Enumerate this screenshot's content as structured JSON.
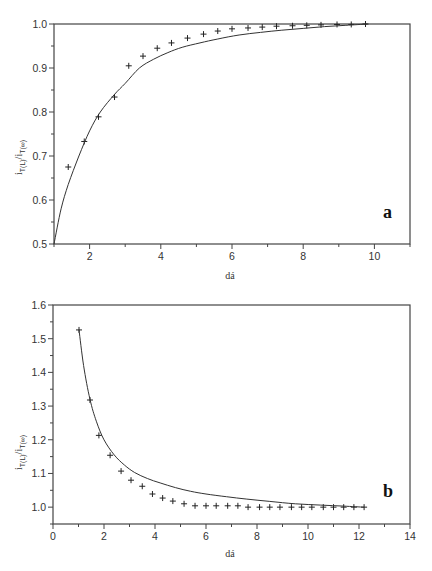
{
  "chart_data": [
    {
      "type": "scatter",
      "panel": "a",
      "title": "",
      "panel_label": "a",
      "xlabel": "dá",
      "ylabel": {
        "main": "i",
        "sub1": "T(L)",
        "slash": "/",
        "main2": "i",
        "sub2": "T(∞)"
      },
      "xlim": [
        1,
        11
      ],
      "ylim": [
        0.5,
        1.0
      ],
      "xticks": [
        2,
        4,
        6,
        8,
        10
      ],
      "xtick_labels": [
        "2",
        "4",
        "6",
        "8",
        "10"
      ],
      "yticks": [
        0.5,
        0.6,
        0.7,
        0.8,
        0.9,
        1.0
      ],
      "ytick_labels": [
        "0.5",
        "0.6",
        "0.7",
        "0.8",
        "0.9",
        "1.0"
      ],
      "grid": false,
      "series": [
        {
          "name": "experimental",
          "style": "markers-plus",
          "x": [
            1.4,
            1.85,
            2.25,
            2.7,
            3.1,
            3.5,
            3.9,
            4.3,
            4.75,
            5.2,
            5.6,
            6.0,
            6.45,
            6.85,
            7.25,
            7.7,
            8.1,
            8.5,
            8.95,
            9.35,
            9.75
          ],
          "y": [
            0.675,
            0.733,
            0.789,
            0.834,
            0.905,
            0.927,
            0.945,
            0.957,
            0.968,
            0.977,
            0.984,
            0.989,
            0.991,
            0.993,
            0.995,
            0.996,
            0.997,
            0.998,
            0.999,
            0.999,
            1.0
          ]
        },
        {
          "name": "theory",
          "style": "line",
          "x": [
            1.0,
            1.2,
            1.4,
            1.7,
            2.0,
            2.3,
            2.7,
            3.0,
            3.4,
            3.8,
            4.2,
            4.6,
            5.1,
            5.6,
            6.2,
            6.8,
            7.4,
            8.0,
            8.6,
            9.2,
            9.8
          ],
          "y": [
            0.5,
            0.58,
            0.635,
            0.7,
            0.757,
            0.8,
            0.84,
            0.865,
            0.9,
            0.92,
            0.935,
            0.947,
            0.957,
            0.966,
            0.975,
            0.981,
            0.986,
            0.99,
            0.994,
            0.997,
            1.0
          ]
        }
      ]
    },
    {
      "type": "scatter",
      "panel": "b",
      "title": "",
      "panel_label": "b",
      "xlabel": "dá",
      "ylabel": {
        "main": "i",
        "sub1": "T(L)",
        "slash": "/",
        "main2": "i",
        "sub2": "T(∞)"
      },
      "xlim": [
        0,
        14
      ],
      "ylim": [
        0.95,
        1.6
      ],
      "xticks": [
        0,
        2,
        4,
        6,
        8,
        10,
        12,
        14
      ],
      "xtick_labels": [
        "0",
        "2",
        "4",
        "6",
        "8",
        "10",
        "12",
        "14"
      ],
      "yticks": [
        1.0,
        1.1,
        1.2,
        1.3,
        1.4,
        1.5,
        1.6
      ],
      "ytick_labels": [
        "1.0",
        "1.1",
        "1.2",
        "1.3",
        "1.4",
        "1.5",
        "1.6"
      ],
      "grid": false,
      "series": [
        {
          "name": "experimental",
          "style": "markers-plus",
          "x": [
            1.02,
            1.45,
            1.8,
            2.24,
            2.67,
            3.06,
            3.5,
            3.9,
            4.3,
            4.7,
            5.14,
            5.57,
            6.0,
            6.4,
            6.85,
            7.25,
            7.65,
            8.1,
            8.5,
            8.9,
            9.35,
            9.75,
            10.15,
            10.6,
            11.0,
            11.4,
            11.8,
            12.2
          ],
          "y": [
            1.526,
            1.318,
            1.213,
            1.154,
            1.107,
            1.08,
            1.062,
            1.039,
            1.027,
            1.018,
            1.01,
            1.004,
            1.004,
            1.004,
            1.004,
            1.004,
            1.0,
            1.0,
            1.0,
            1.0,
            1.0,
            1.0,
            1.0,
            1.0,
            1.0,
            1.0,
            1.0,
            1.0
          ]
        },
        {
          "name": "theory",
          "style": "line",
          "x": [
            1.02,
            1.2,
            1.45,
            1.7,
            2.0,
            2.4,
            2.8,
            3.2,
            3.7,
            4.2,
            4.8,
            5.4,
            6.0,
            6.8,
            7.6,
            8.5,
            9.5,
            10.5,
            11.4,
            12.2
          ],
          "y": [
            1.526,
            1.42,
            1.32,
            1.255,
            1.2,
            1.155,
            1.125,
            1.103,
            1.085,
            1.072,
            1.058,
            1.047,
            1.039,
            1.031,
            1.024,
            1.017,
            1.01,
            1.006,
            1.003,
            1.0
          ]
        }
      ]
    }
  ]
}
